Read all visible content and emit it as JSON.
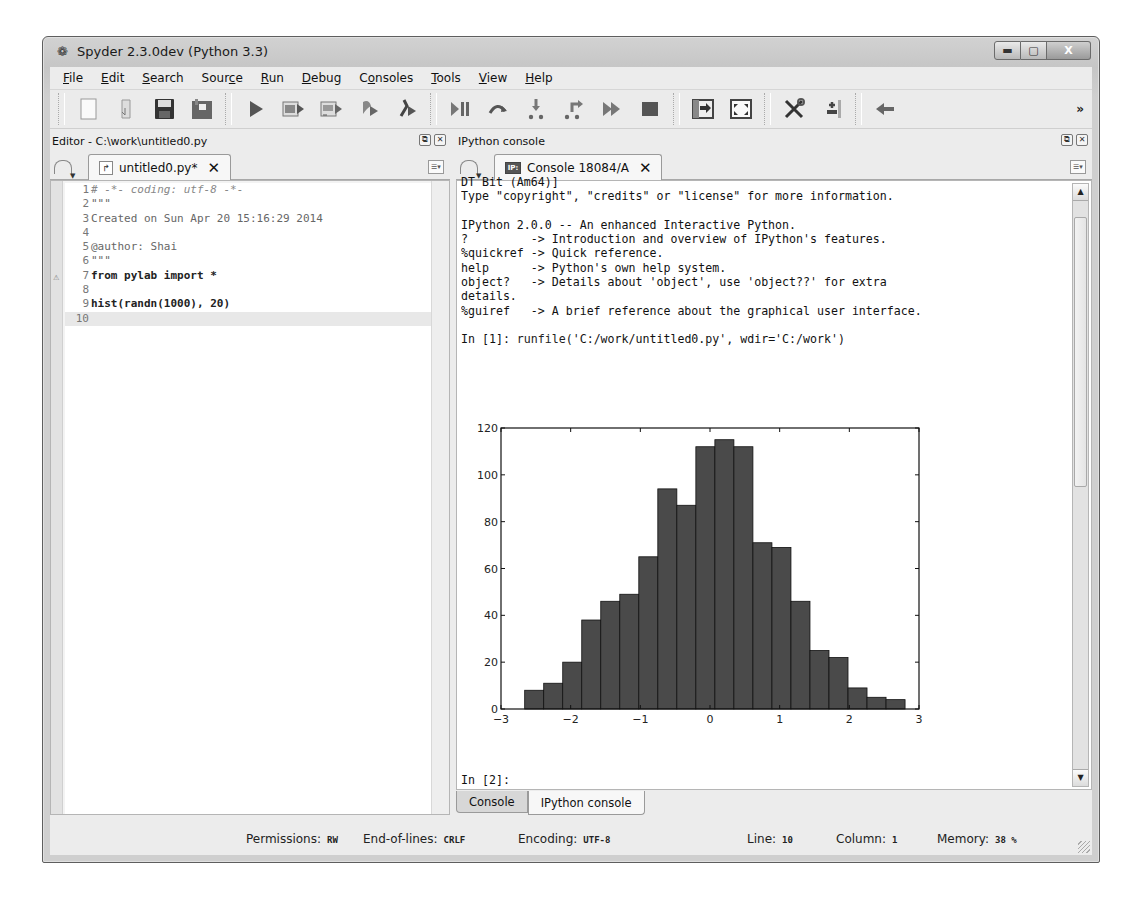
{
  "window": {
    "title": "Spyder 2.3.0dev (Python 3.3)",
    "app_icon": "spyder-icon",
    "controls": [
      "minimize",
      "maximize",
      "close"
    ]
  },
  "menubar": {
    "items": [
      {
        "label": "File",
        "mnemonic": "F"
      },
      {
        "label": "Edit",
        "mnemonic": "E"
      },
      {
        "label": "Search",
        "mnemonic": "S"
      },
      {
        "label": "Source",
        "mnemonic": "c"
      },
      {
        "label": "Run",
        "mnemonic": "R"
      },
      {
        "label": "Debug",
        "mnemonic": "D"
      },
      {
        "label": "Consoles",
        "mnemonic": "o"
      },
      {
        "label": "Tools",
        "mnemonic": "T"
      },
      {
        "label": "View",
        "mnemonic": "V"
      },
      {
        "label": "Help",
        "mnemonic": "H"
      }
    ]
  },
  "toolbar": {
    "groups": [
      [
        "new-file-icon",
        "open-file-icon",
        "save-icon",
        "save-all-icon"
      ],
      [
        "run-icon",
        "run-cell-icon",
        "run-cell-advance-icon",
        "run-selection-icon",
        "configure-run-icon"
      ],
      [
        "debug-icon",
        "step-over-icon",
        "step-into-icon",
        "step-return-icon",
        "continue-icon",
        "stop-debug-icon"
      ],
      [
        "maximize-pane-icon",
        "fullscreen-icon"
      ],
      [
        "preferences-icon",
        "pythonpath-manager-icon"
      ],
      [
        "back-arrow-icon"
      ]
    ],
    "more_label": "»"
  },
  "editor": {
    "pane_title": "Editor - C:\\work\\untitled0.py",
    "tab_label": "untitled0.py*",
    "lines": [
      {
        "n": "1",
        "text": "# -*- coding: utf-8 -*-",
        "style": "comment"
      },
      {
        "n": "2",
        "text": "\"\"\"",
        "style": "str"
      },
      {
        "n": "3",
        "text": "Created on Sun Apr 20 15:16:29 2014",
        "style": "str"
      },
      {
        "n": "4",
        "text": "",
        "style": "str"
      },
      {
        "n": "5",
        "text": "@author: Shai",
        "style": "str"
      },
      {
        "n": "6",
        "text": "\"\"\"",
        "style": "str"
      },
      {
        "n": "7",
        "text": "from pylab import *",
        "style": "bold",
        "warning": true
      },
      {
        "n": "8",
        "text": "",
        "style": "plain"
      },
      {
        "n": "9",
        "text": "hist(randn(1000), 20)",
        "style": "bold"
      },
      {
        "n": "10",
        "text": "",
        "style": "current"
      }
    ]
  },
  "console": {
    "pane_title": "IPython console",
    "tab_label": "Console 18084/A",
    "lines": [
      "DT Bit (Am64)]",
      "Type \"copyright\", \"credits\" or \"license\" for more information.",
      "",
      "IPython 2.0.0 -- An enhanced Interactive Python.",
      "?         -> Introduction and overview of IPython's features.",
      "%quickref -> Quick reference.",
      "help      -> Python's own help system.",
      "object?   -> Details about 'object', use 'object??' for extra",
      "details.",
      "%guiref   -> A brief reference about the graphical user interface.",
      "",
      "In [1]: runfile('C:/work/untitled0.py', wdir='C:/work')"
    ],
    "prompt": "In [2]:",
    "bottom_tabs": [
      {
        "label": "Console",
        "active": false
      },
      {
        "label": "IPython console",
        "active": true
      }
    ]
  },
  "chart_data": {
    "type": "bar",
    "title": "",
    "xlabel": "",
    "ylabel": "",
    "bin_edges_start": -2.66,
    "bin_width": 0.273,
    "categories": [
      "-2.66",
      "-2.39",
      "-2.12",
      "-1.84",
      "-1.57",
      "-1.30",
      "-1.02",
      "-0.75",
      "-0.48",
      "-0.20",
      "0.07",
      "0.34",
      "0.62",
      "0.89",
      "1.16",
      "1.44",
      "1.71",
      "1.98",
      "2.25",
      "2.53"
    ],
    "values": [
      8,
      11,
      20,
      38,
      46,
      49,
      65,
      94,
      87,
      112,
      115,
      112,
      71,
      69,
      46,
      25,
      22,
      9,
      5,
      4
    ],
    "xlim": [
      -3,
      3
    ],
    "ylim": [
      0,
      120
    ],
    "xticks": [
      "−3",
      "−2",
      "−1",
      "0",
      "1",
      "2",
      "3"
    ],
    "yticks": [
      "0",
      "20",
      "40",
      "60",
      "80",
      "100",
      "120"
    ],
    "grid": false,
    "bar_color": "#4a4a4a"
  },
  "statusbar": {
    "permissions_label": "Permissions:",
    "permissions": "RW",
    "eol_label": "End-of-lines:",
    "eol": "CRLF",
    "encoding_label": "Encoding:",
    "encoding": "UTF-8",
    "line_label": "Line:",
    "line": "10",
    "column_label": "Column:",
    "column": "1",
    "memory_label": "Memory:",
    "memory": "38 %"
  }
}
